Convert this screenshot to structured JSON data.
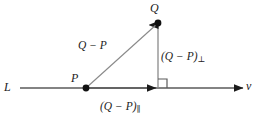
{
  "figure": {
    "type": "geometry-diagram",
    "background_color": "#ffffff",
    "stroke_color": "#5a5a5a",
    "text_color": "#1b1b1b",
    "labels": {
      "line_label": "L",
      "point_p_label": "P",
      "point_q_label": "Q",
      "direction_label": "v",
      "diagonal_label": "Q − P",
      "perpendicular_component_base": "(Q − P)",
      "perpendicular_component_subscript": "⊥",
      "parallel_component_base": "(Q − P)",
      "parallel_component_subscript": "∥"
    },
    "geometry": {
      "line_start_x": 20,
      "line_end_x": 243,
      "line_y": 88,
      "point_p_x": 86,
      "point_p_y": 88,
      "point_q_x": 158,
      "point_q_y": 23,
      "foot_x": 158,
      "foot_y": 88,
      "right_angle_marker_size": 9,
      "dot_radius": 3.2
    }
  }
}
